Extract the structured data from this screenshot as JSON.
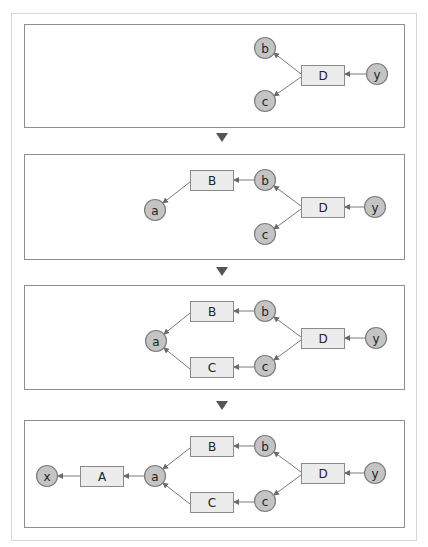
{
  "diagram": {
    "frame": {
      "x": 11,
      "y": 13,
      "w": 405,
      "h": 527
    },
    "colors": {
      "panel_border": "#8e8e8e",
      "frame_border": "#d6d6d6",
      "separator": "#555555",
      "edge": "#7a7a7a",
      "rect_fill": "#ececec",
      "circle_fill": "#c4c4c4"
    },
    "separators": [
      {
        "cx": 222,
        "y": 133
      },
      {
        "cx": 222,
        "y": 267
      },
      {
        "cx": 222,
        "y": 401
      }
    ],
    "panels": [
      {
        "name": "step-1",
        "box": {
          "x": 24,
          "y": 24,
          "w": 380,
          "h": 103
        },
        "nodes": [
          {
            "id": "b",
            "label": "b",
            "shape": "circle",
            "cx": 265,
            "cy": 48
          },
          {
            "id": "c",
            "label": "c",
            "shape": "circle",
            "cx": 265,
            "cy": 101
          },
          {
            "id": "D",
            "label": "D",
            "shape": "rect",
            "x": 301,
            "y": 65,
            "w": 43,
            "h": 20
          },
          {
            "id": "y",
            "label": "y",
            "shape": "circle",
            "cx": 377,
            "cy": 74
          }
        ],
        "edges": [
          {
            "from": "y",
            "to": "D",
            "x1": 366,
            "y1": 74,
            "x2": 345,
            "y2": 74
          },
          {
            "from": "D",
            "to": "b",
            "x1": 301,
            "y1": 74,
            "x2": 274,
            "y2": 53
          },
          {
            "from": "D",
            "to": "c",
            "x1": 301,
            "y1": 77,
            "x2": 274,
            "y2": 96
          }
        ]
      },
      {
        "name": "step-2",
        "box": {
          "x": 24,
          "y": 154,
          "w": 380,
          "h": 105
        },
        "nodes": [
          {
            "id": "B",
            "label": "B",
            "shape": "rect",
            "x": 190,
            "y": 170,
            "w": 43,
            "h": 20
          },
          {
            "id": "b",
            "label": "b",
            "shape": "circle",
            "cx": 265,
            "cy": 180
          },
          {
            "id": "a",
            "label": "a",
            "shape": "circle",
            "cx": 155,
            "cy": 210
          },
          {
            "id": "D",
            "label": "D",
            "shape": "rect",
            "x": 301,
            "y": 197,
            "w": 43,
            "h": 20
          },
          {
            "id": "y",
            "label": "y",
            "shape": "circle",
            "cx": 375,
            "cy": 207
          },
          {
            "id": "c",
            "label": "c",
            "shape": "circle",
            "cx": 265,
            "cy": 234
          }
        ],
        "edges": [
          {
            "from": "y",
            "to": "D",
            "x1": 364,
            "y1": 207,
            "x2": 345,
            "y2": 207
          },
          {
            "from": "D",
            "to": "b",
            "x1": 301,
            "y1": 206,
            "x2": 274,
            "y2": 186
          },
          {
            "from": "D",
            "to": "c",
            "x1": 301,
            "y1": 209,
            "x2": 274,
            "y2": 229
          },
          {
            "from": "b",
            "to": "B",
            "x1": 254,
            "y1": 180,
            "x2": 234,
            "y2": 180
          },
          {
            "from": "B",
            "to": "a",
            "x1": 190,
            "y1": 182,
            "x2": 163,
            "y2": 203
          }
        ]
      },
      {
        "name": "step-3",
        "box": {
          "x": 24,
          "y": 285,
          "w": 380,
          "h": 104
        },
        "nodes": [
          {
            "id": "B",
            "label": "B",
            "shape": "rect",
            "x": 190,
            "y": 301,
            "w": 43,
            "h": 20
          },
          {
            "id": "b",
            "label": "b",
            "shape": "circle",
            "cx": 265,
            "cy": 311
          },
          {
            "id": "a",
            "label": "a",
            "shape": "circle",
            "cx": 156,
            "cy": 341
          },
          {
            "id": "D",
            "label": "D",
            "shape": "rect",
            "x": 301,
            "y": 328,
            "w": 43,
            "h": 20
          },
          {
            "id": "y",
            "label": "y",
            "shape": "circle",
            "cx": 376,
            "cy": 338
          },
          {
            "id": "C",
            "label": "C",
            "shape": "rect",
            "x": 190,
            "y": 357,
            "w": 43,
            "h": 20
          },
          {
            "id": "c",
            "label": "c",
            "shape": "circle",
            "cx": 265,
            "cy": 366
          }
        ],
        "edges": [
          {
            "from": "y",
            "to": "D",
            "x1": 365,
            "y1": 338,
            "x2": 345,
            "y2": 338
          },
          {
            "from": "D",
            "to": "b",
            "x1": 301,
            "y1": 337,
            "x2": 274,
            "y2": 317
          },
          {
            "from": "D",
            "to": "c",
            "x1": 301,
            "y1": 340,
            "x2": 274,
            "y2": 360
          },
          {
            "from": "b",
            "to": "B",
            "x1": 254,
            "y1": 311,
            "x2": 234,
            "y2": 311
          },
          {
            "from": "c",
            "to": "C",
            "x1": 254,
            "y1": 367,
            "x2": 234,
            "y2": 367
          },
          {
            "from": "B",
            "to": "a",
            "x1": 190,
            "y1": 313,
            "x2": 164,
            "y2": 334
          },
          {
            "from": "C",
            "to": "a",
            "x1": 190,
            "y1": 369,
            "x2": 164,
            "y2": 348
          }
        ]
      },
      {
        "name": "step-4",
        "box": {
          "x": 24,
          "y": 420,
          "w": 380,
          "h": 107
        },
        "nodes": [
          {
            "id": "x",
            "label": "x",
            "shape": "circle",
            "cx": 47,
            "cy": 476
          },
          {
            "id": "A",
            "label": "A",
            "shape": "rect",
            "x": 80,
            "y": 466,
            "w": 43,
            "h": 20
          },
          {
            "id": "a",
            "label": "a",
            "shape": "circle",
            "cx": 155,
            "cy": 476
          },
          {
            "id": "B",
            "label": "B",
            "shape": "rect",
            "x": 190,
            "y": 436,
            "w": 43,
            "h": 20
          },
          {
            "id": "b",
            "label": "b",
            "shape": "circle",
            "cx": 265,
            "cy": 446
          },
          {
            "id": "C",
            "label": "C",
            "shape": "rect",
            "x": 190,
            "y": 492,
            "w": 43,
            "h": 20
          },
          {
            "id": "c",
            "label": "c",
            "shape": "circle",
            "cx": 265,
            "cy": 501
          },
          {
            "id": "D",
            "label": "D",
            "shape": "rect",
            "x": 301,
            "y": 463,
            "w": 43,
            "h": 20
          },
          {
            "id": "y",
            "label": "y",
            "shape": "circle",
            "cx": 375,
            "cy": 473
          }
        ],
        "edges": [
          {
            "from": "y",
            "to": "D",
            "x1": 364,
            "y1": 473,
            "x2": 345,
            "y2": 473
          },
          {
            "from": "D",
            "to": "b",
            "x1": 301,
            "y1": 472,
            "x2": 274,
            "y2": 452
          },
          {
            "from": "D",
            "to": "c",
            "x1": 301,
            "y1": 475,
            "x2": 274,
            "y2": 495
          },
          {
            "from": "b",
            "to": "B",
            "x1": 254,
            "y1": 446,
            "x2": 234,
            "y2": 446
          },
          {
            "from": "c",
            "to": "C",
            "x1": 254,
            "y1": 502,
            "x2": 234,
            "y2": 502
          },
          {
            "from": "B",
            "to": "a",
            "x1": 190,
            "y1": 448,
            "x2": 163,
            "y2": 469
          },
          {
            "from": "C",
            "to": "a",
            "x1": 190,
            "y1": 504,
            "x2": 163,
            "y2": 483
          },
          {
            "from": "a",
            "to": "A",
            "x1": 144,
            "y1": 476,
            "x2": 124,
            "y2": 476
          },
          {
            "from": "A",
            "to": "x",
            "x1": 80,
            "y1": 476,
            "x2": 58,
            "y2": 476
          }
        ]
      }
    ]
  }
}
